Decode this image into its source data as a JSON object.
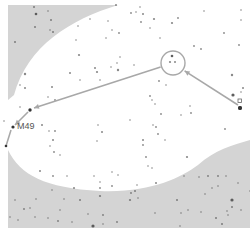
{
  "map": {
    "type": "star-hop finder chart",
    "background_color": "#ffffff",
    "mask_color": "#d4d4d4",
    "line_color": "#a8a8a8",
    "star_color": "#555555",
    "target_label": "M49",
    "frame": {
      "x": 8,
      "y": 5,
      "w": 242,
      "h": 223
    }
  },
  "chart_data": {
    "type": "scatter",
    "title": "",
    "annotations": [
      {
        "text": "M49",
        "x": 17,
        "y": 127
      }
    ],
    "hop_path": [
      {
        "x": 240,
        "y": 108,
        "kind": "start-star"
      },
      {
        "x": 173,
        "y": 63,
        "kind": "circled-asterism"
      },
      {
        "x": 30,
        "y": 110,
        "kind": "waypoint-star"
      },
      {
        "x": 13,
        "y": 127,
        "kind": "target"
      }
    ],
    "circle": {
      "cx": 173,
      "cy": 63,
      "r": 12
    },
    "stars": [
      [
        34,
        7,
        1
      ],
      [
        36,
        14,
        1.3
      ],
      [
        48,
        11,
        0.8
      ],
      [
        35,
        27,
        1
      ],
      [
        15,
        42,
        1
      ],
      [
        51,
        20,
        1
      ],
      [
        53,
        32,
        1
      ],
      [
        50,
        30,
        0.8
      ],
      [
        78,
        26,
        0.8
      ],
      [
        90,
        19,
        0.8
      ],
      [
        116,
        5,
        1
      ],
      [
        76,
        40,
        0.8
      ],
      [
        79,
        55,
        1.1
      ],
      [
        70,
        73,
        1
      ],
      [
        80,
        80,
        0.8
      ],
      [
        25,
        74,
        1.2
      ],
      [
        20,
        85,
        0.8
      ],
      [
        25,
        88,
        1
      ],
      [
        52,
        87,
        1
      ],
      [
        48,
        97,
        0.8
      ],
      [
        55,
        100,
        0.9
      ],
      [
        20,
        107,
        0.8
      ],
      [
        100,
        80,
        0.8
      ],
      [
        95,
        68,
        1
      ],
      [
        97,
        72,
        1.1
      ],
      [
        111,
        67,
        0.8
      ],
      [
        118,
        70,
        1.2
      ],
      [
        117,
        63,
        0.8
      ],
      [
        120,
        57,
        0.8
      ],
      [
        106,
        38,
        0.8
      ],
      [
        119,
        33,
        0.9
      ],
      [
        112,
        30,
        0.8
      ],
      [
        108,
        21,
        0.8
      ],
      [
        143,
        14,
        1
      ],
      [
        141,
        22,
        0.9
      ],
      [
        154,
        19,
        1.1
      ],
      [
        150,
        28,
        0.8
      ],
      [
        172,
        23,
        1.1
      ],
      [
        178,
        18,
        0.9
      ],
      [
        160,
        38,
        0.8
      ],
      [
        172,
        56,
        1.3
      ],
      [
        170,
        62,
        1.1
      ],
      [
        175,
        62,
        1
      ],
      [
        194,
        46,
        0.9
      ],
      [
        201,
        49,
        0.9
      ],
      [
        224,
        33,
        0.9
      ],
      [
        241,
        10,
        0.8
      ],
      [
        241,
        20,
        0.8
      ],
      [
        239,
        45,
        0.9
      ],
      [
        232,
        75,
        1.2
      ],
      [
        243,
        88,
        1
      ],
      [
        241,
        92,
        0.8
      ],
      [
        131,
        13,
        0.9
      ],
      [
        136,
        12,
        0.8
      ],
      [
        140,
        7,
        0.8
      ],
      [
        134,
        65,
        0.8
      ],
      [
        159,
        81,
        0.9
      ],
      [
        166,
        85,
        0.8
      ],
      [
        150,
        96,
        0.9
      ],
      [
        152,
        100,
        0.8
      ],
      [
        155,
        104,
        0.8
      ],
      [
        161,
        114,
        0.9
      ],
      [
        181,
        115,
        0.8
      ],
      [
        190,
        106,
        0.8
      ],
      [
        191,
        113,
        0.9
      ],
      [
        233,
        95,
        1.6
      ],
      [
        240,
        108,
        2
      ],
      [
        4,
        121,
        0.8
      ],
      [
        42,
        125,
        1
      ],
      [
        49,
        131,
        0.8
      ],
      [
        55,
        131,
        0.9
      ],
      [
        53,
        140,
        1
      ],
      [
        50,
        146,
        0.8
      ],
      [
        54,
        152,
        0.9
      ],
      [
        60,
        155,
        0.8
      ],
      [
        40,
        171,
        1
      ],
      [
        53,
        176,
        0.9
      ],
      [
        67,
        176,
        0.8
      ],
      [
        52,
        190,
        0.8
      ],
      [
        74,
        188,
        1
      ],
      [
        80,
        200,
        1
      ],
      [
        100,
        196,
        1.1
      ],
      [
        100,
        188,
        0.9
      ],
      [
        100,
        182,
        0.8
      ],
      [
        94,
        176,
        0.8
      ],
      [
        97,
        141,
        0.8
      ],
      [
        102,
        132,
        1
      ],
      [
        98,
        125,
        0.8
      ],
      [
        112,
        172,
        0.8
      ],
      [
        118,
        175,
        0.8
      ],
      [
        112,
        186,
        0.9
      ],
      [
        103,
        215,
        0.9
      ],
      [
        117,
        222,
        0.9
      ],
      [
        130,
        120,
        0.8
      ],
      [
        153,
        125,
        0.8
      ],
      [
        158,
        134,
        0.9
      ],
      [
        165,
        140,
        0.8
      ],
      [
        156,
        127,
        0.9
      ],
      [
        143,
        140,
        1
      ],
      [
        143,
        145,
        0.9
      ],
      [
        146,
        157,
        0.9
      ],
      [
        148,
        166,
        0.8
      ],
      [
        152,
        168,
        0.8
      ],
      [
        135,
        191,
        1
      ],
      [
        137,
        185,
        0.8
      ],
      [
        131,
        193,
        0.9
      ],
      [
        130,
        200,
        1.1
      ],
      [
        138,
        198,
        0.8
      ],
      [
        156,
        183,
        1
      ],
      [
        155,
        213,
        0.8
      ],
      [
        177,
        200,
        1
      ],
      [
        188,
        210,
        0.8
      ],
      [
        181,
        213,
        0.8
      ],
      [
        180,
        226,
        0.8
      ],
      [
        201,
        212,
        0.8
      ],
      [
        216,
        218,
        1
      ],
      [
        222,
        224,
        1
      ],
      [
        227,
        211,
        0.8
      ],
      [
        226,
        176,
        0.8
      ],
      [
        218,
        176,
        0.9
      ],
      [
        218,
        186,
        0.8
      ],
      [
        208,
        176,
        0.9
      ],
      [
        212,
        188,
        0.8
      ],
      [
        187,
        157,
        1.1
      ],
      [
        184,
        176,
        0.8
      ],
      [
        199,
        177,
        0.8
      ],
      [
        205,
        194,
        0.8
      ],
      [
        232,
        200,
        1.6
      ],
      [
        232,
        207,
        1
      ],
      [
        228,
        215,
        0.8
      ],
      [
        238,
        183,
        0.8
      ],
      [
        241,
        210,
        0.8
      ],
      [
        250,
        191,
        0.8
      ],
      [
        24,
        209,
        0.9
      ],
      [
        30,
        208,
        0.8
      ],
      [
        35,
        217,
        0.8
      ],
      [
        48,
        218,
        0.8
      ],
      [
        15,
        200,
        0.8
      ],
      [
        18,
        220,
        0.8
      ],
      [
        10,
        217,
        0.8
      ],
      [
        36,
        199,
        0.8
      ],
      [
        58,
        221,
        0.9
      ],
      [
        72,
        222,
        0.8
      ],
      [
        93,
        226,
        1.6
      ],
      [
        103,
        224,
        0.8
      ],
      [
        64,
        199,
        0.8
      ],
      [
        60,
        210,
        0.8
      ],
      [
        88,
        214,
        0.8
      ],
      [
        204,
        11,
        0.8
      ],
      [
        225,
        129,
        0.9
      ]
    ]
  }
}
